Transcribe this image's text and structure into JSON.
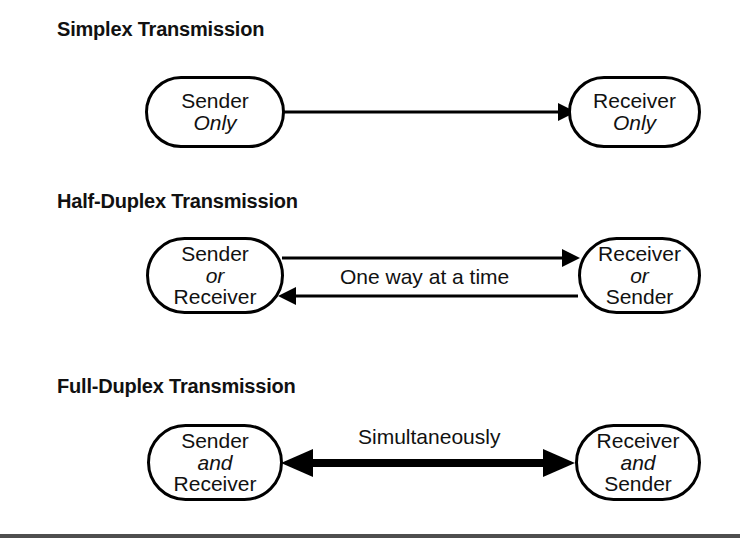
{
  "diagram": {
    "title_simplex": "Simplex Transmission",
    "title_half_duplex": "Half-Duplex Transmission",
    "title_full_duplex": "Full-Duplex Transmission"
  },
  "simplex": {
    "left_node": {
      "line1": "Sender",
      "line2": "Only"
    },
    "right_node": {
      "line1": "Receiver",
      "line2": "Only"
    },
    "arrow": {
      "name": "arrow-right-thin",
      "direction": "right",
      "label": ""
    }
  },
  "half_duplex": {
    "left_node": {
      "line1": "Sender",
      "line2": "or",
      "line3": "Receiver"
    },
    "right_node": {
      "line1": "Receiver",
      "line2": "or",
      "line3": "Sender"
    },
    "label": "One way at a time",
    "arrow_top": {
      "name": "arrow-right-thin",
      "direction": "right"
    },
    "arrow_bottom": {
      "name": "arrow-left-thin",
      "direction": "left"
    }
  },
  "full_duplex": {
    "left_node": {
      "line1": "Sender",
      "line2": "and",
      "line3": "Receiver"
    },
    "right_node": {
      "line1": "Receiver",
      "line2": "and",
      "line3": "Sender"
    },
    "label": "Simultaneously",
    "arrow": {
      "name": "arrow-bidirectional-thick",
      "direction": "both"
    }
  },
  "colors": {
    "stroke": "#000000",
    "text": "#111111",
    "background": "#ffffff",
    "footer_rule": "#4f4f4f"
  }
}
